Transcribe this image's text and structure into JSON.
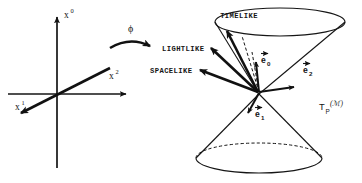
{
  "figure": {
    "background_color": "#ffffff",
    "ink_color": "#151515"
  },
  "left_diagram": {
    "name": "coordinate-chart-axes",
    "axes": [
      {
        "id": "x0",
        "base": "x",
        "exponent": "0",
        "direction": "up",
        "label_x": 64,
        "label_y": 18
      },
      {
        "id": "x1",
        "base": "x",
        "exponent": "1",
        "direction": "down-left",
        "label_x": 15,
        "label_y": 110
      },
      {
        "id": "x2",
        "base": "x",
        "exponent": "2",
        "direction": "right",
        "label_x": 109,
        "label_y": 79
      }
    ]
  },
  "map_arrow": {
    "name": "phi-map-arrow",
    "symbol": "ϕ",
    "label_x": 128,
    "label_y": 32
  },
  "right_diagram": {
    "name": "light-cone",
    "region_labels": [
      {
        "id": "timelike",
        "text": "TIMELIKE",
        "x": 239,
        "y": 18
      },
      {
        "id": "lightlike",
        "text": "LIGHTLIKE",
        "x": 162,
        "y": 51
      },
      {
        "id": "spacelike",
        "text": "SPACELIKE",
        "x": 150,
        "y": 73
      }
    ],
    "basis_vectors": [
      {
        "id": "e0",
        "base": "e",
        "subscript": "0",
        "label_x": 261,
        "label_y": 63,
        "arrow_accent": true
      },
      {
        "id": "e1",
        "base": "e",
        "subscript": "1",
        "label_x": 255,
        "label_y": 117,
        "arrow_accent": true
      },
      {
        "id": "e2",
        "base": "e",
        "subscript": "2",
        "label_x": 303,
        "label_y": 73,
        "arrow_accent": true
      }
    ],
    "tangent_space_label": {
      "id": "tangent-space",
      "base": "T",
      "subscript": "P",
      "argument": "(ℳ)",
      "x": 319,
      "y": 110
    }
  },
  "colors": {
    "ink": "#151515",
    "bold_ink": "#111111",
    "paper": "#ffffff"
  }
}
